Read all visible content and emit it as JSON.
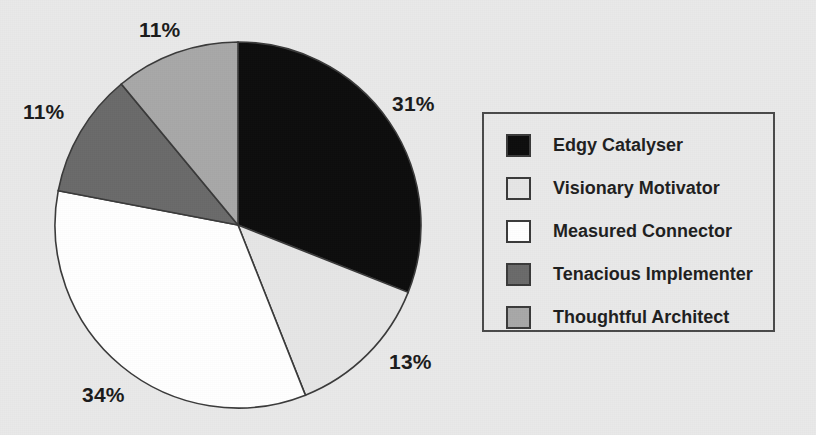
{
  "chart_data": {
    "type": "pie",
    "title": "",
    "categories": [
      "Edgy Catalyser",
      "Visionary Motivator",
      "Measured Connector",
      "Tenacious Implementer",
      "Thoughtful Architect"
    ],
    "values": [
      31,
      13,
      34,
      11,
      11
    ],
    "value_labels": [
      "31%",
      "13%",
      "34%",
      "11%",
      "11%"
    ],
    "unit": "%",
    "colors": [
      "#0d0d0d",
      "#e6e6e6",
      "#ffffff",
      "#6a6a6a",
      "#a8a8a8"
    ],
    "start_angle_deg": 0,
    "direction": "clockwise",
    "legend_position": "right",
    "grid": false,
    "xlabel": "",
    "ylabel": ""
  },
  "pie": {
    "labels": [
      {
        "text": "31%",
        "left": 392,
        "top": 92
      },
      {
        "text": "13%",
        "left": 389,
        "top": 350
      },
      {
        "text": "34%",
        "left": 82,
        "top": 383
      },
      {
        "text": "11%",
        "left": 23,
        "top": 100
      },
      {
        "text": "11%",
        "left": 139,
        "top": 18
      }
    ]
  },
  "legend": {
    "items": [
      {
        "label": "Edgy Catalyser",
        "color": "#0d0d0d",
        "top": 18
      },
      {
        "label": "Visionary Motivator",
        "color": "#e6e6e6",
        "top": 61
      },
      {
        "label": "Measured Connector",
        "color": "#ffffff",
        "top": 104
      },
      {
        "label": "Tenacious Implementer",
        "color": "#6a6a6a",
        "top": 147
      },
      {
        "label": "Thoughtful Architect",
        "color": "#a8a8a8",
        "top": 190
      }
    ]
  },
  "theme": {
    "background": "#e9e9e9",
    "outline": "#3a3a3a",
    "text": "#1f1f1f"
  }
}
